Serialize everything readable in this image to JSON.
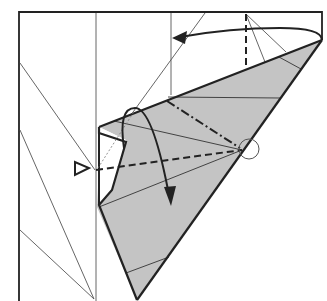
{
  "diagram": {
    "type": "origami-folding-step",
    "colors": {
      "paper_front": "#ffffff",
      "paper_back": "#c4c4c4",
      "line": "#222222",
      "crease": "#555555"
    },
    "symbols": [
      {
        "name": "valley-fold-line",
        "style": "dashed"
      },
      {
        "name": "mountain-fold-line",
        "style": "dash-dot"
      },
      {
        "name": "fold-arrow",
        "direction": "left"
      },
      {
        "name": "fold-arrow",
        "direction": "down"
      },
      {
        "name": "push-arrow",
        "style": "hollow-triangle"
      },
      {
        "name": "reference-point-circle"
      }
    ]
  }
}
